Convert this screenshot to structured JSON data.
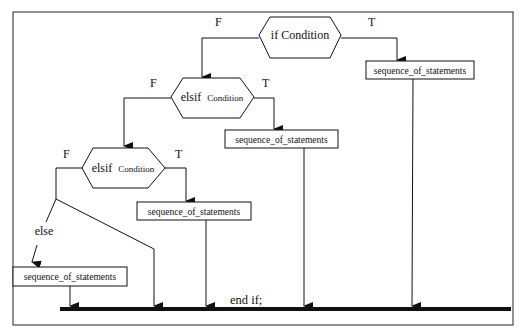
{
  "diagram": {
    "colors": {
      "stroke": "#111111",
      "background": "#ffffff"
    },
    "decisions": [
      {
        "id": "if",
        "keyword": "if",
        "condition": "Condition",
        "false_label": "F",
        "true_label": "T"
      },
      {
        "id": "elsif1",
        "keyword": "elsif",
        "condition": "Condition",
        "false_label": "F",
        "true_label": "T"
      },
      {
        "id": "elsif2",
        "keyword": "elsif",
        "condition": "Condition",
        "false_label": "F",
        "true_label": "T"
      }
    ],
    "statements": [
      {
        "id": "stmt-if",
        "label": "sequence_of_statements"
      },
      {
        "id": "stmt-elsif1",
        "label": "sequence_of_statements"
      },
      {
        "id": "stmt-elsif2",
        "label": "sequence_of_statements"
      },
      {
        "id": "stmt-else",
        "label": "sequence_of_statements"
      }
    ],
    "else_label": "else",
    "end_label": "end if;"
  }
}
